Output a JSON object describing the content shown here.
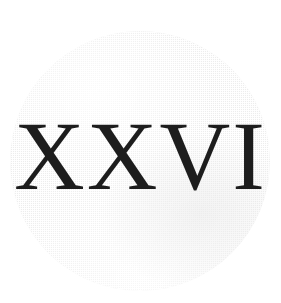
{
  "page": {
    "kind": "scanned-plate",
    "background_color": "#ffffff",
    "width": 281,
    "height": 303
  },
  "disc": {
    "name": "halftone-disc",
    "shape": "circle",
    "center_x": 140,
    "center_y": 161,
    "radius": 130,
    "fill_color": "#ededed",
    "texture": "fine checkerboard halftone dither",
    "edge": "soft / blurred scan edge"
  },
  "numeral": {
    "text": "XXVI",
    "value": 26,
    "system": "roman",
    "ink_color": "#1d1d1d",
    "style": "high-contrast serif",
    "cap_height_px": 71,
    "baseline_y": 193,
    "left_x": 24,
    "right_x": 250,
    "letters": [
      "X",
      "X",
      "V",
      "I"
    ]
  }
}
